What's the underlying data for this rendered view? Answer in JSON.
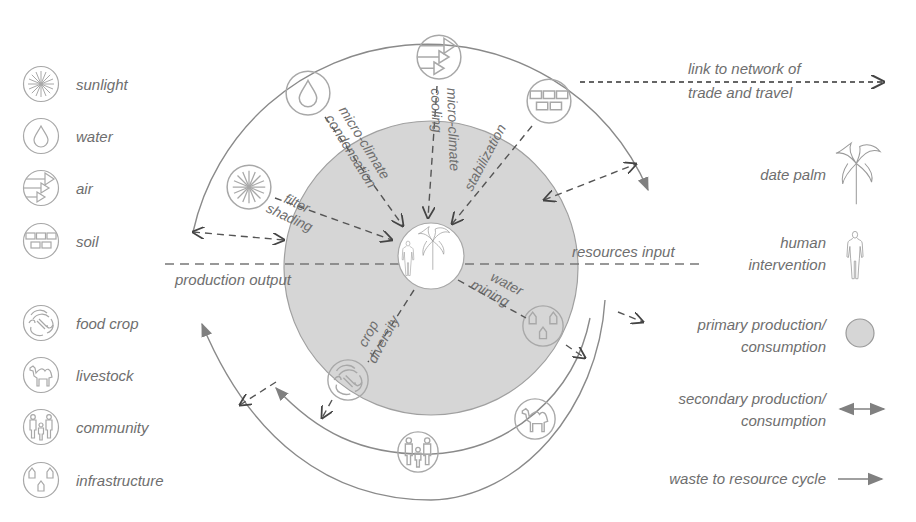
{
  "diagram": {
    "type": "radial ecosystem diagram",
    "center": {
      "icons": [
        "human-icon",
        "date-palm-icon"
      ]
    },
    "colors": {
      "primary_fill": "#d6d6d6",
      "line": "#8a8a8a",
      "dash": "#555555",
      "text": "#6e6e6e"
    },
    "axis_labels": {
      "left": "production output",
      "right": "resources input"
    },
    "radial_labels": {
      "filter_shading": [
        "filter",
        "shading"
      ],
      "condensation": [
        "micro-climate",
        "condensation"
      ],
      "cooling": [
        "micro-climate",
        "cooling"
      ],
      "stabilization": "stabilization",
      "water_mining": [
        "water",
        "mining"
      ],
      "crop_diversity": [
        "crop",
        "diversity"
      ]
    },
    "network_link": [
      "link to network of",
      "trade and travel"
    ]
  },
  "legend_left": {
    "items": [
      {
        "icon": "sunlight-icon",
        "label": "sunlight"
      },
      {
        "icon": "water-icon",
        "label": "water"
      },
      {
        "icon": "air-icon",
        "label": "air"
      },
      {
        "icon": "soil-icon",
        "label": "soil"
      },
      {
        "icon": "food-crop-icon",
        "label": "food crop"
      },
      {
        "icon": "livestock-icon",
        "label": "livestock"
      },
      {
        "icon": "community-icon",
        "label": "community"
      },
      {
        "icon": "infrastructure-icon",
        "label": "infrastructure"
      }
    ]
  },
  "legend_right": {
    "date_palm": "date palm",
    "human": [
      "human",
      "intervention"
    ],
    "primary": [
      "primary production/",
      "consumption"
    ],
    "secondary": [
      "secondary production/",
      "consumption"
    ],
    "waste": "waste to resource cycle"
  }
}
